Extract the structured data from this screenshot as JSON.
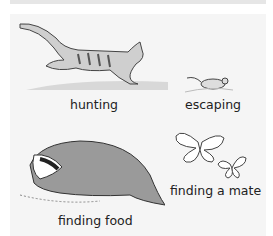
{
  "illustration": {
    "colors": {
      "panel": "#f5f5f5",
      "top_band": "#e6e6e6",
      "ink": "#333333",
      "text": "#222222"
    },
    "scenes": [
      {
        "id": "cat",
        "label": "hunting",
        "icon": "cat-icon"
      },
      {
        "id": "mouse",
        "label": "escaping",
        "icon": "mouse-icon"
      },
      {
        "id": "badger",
        "label": "finding food",
        "icon": "badger-icon"
      },
      {
        "id": "butterflies",
        "label": "finding a mate",
        "icon": "butterfly-icon"
      }
    ]
  }
}
